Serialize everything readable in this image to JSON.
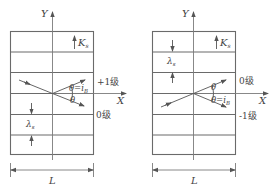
{
  "panels": [
    {
      "id": "left",
      "y_axis_label": "Y",
      "x_axis_label": "X",
      "wave_vector_label": "K",
      "wave_vector_sub": "s",
      "wavelength_label": "λ",
      "wavelength_sub": "s",
      "angle_upper": "θ=i",
      "angle_upper_sub": "B",
      "angle_lower": "θ",
      "order_upper": "+1级",
      "order_lower": "0级",
      "width_label": "L"
    },
    {
      "id": "right",
      "y_axis_label": "Y",
      "x_axis_label": "X",
      "wave_vector_label": "K",
      "wave_vector_sub": "s",
      "wavelength_label": "λ",
      "wavelength_sub": "s",
      "angle_upper": "θ",
      "angle_lower": "θ=i",
      "angle_lower_sub": "B",
      "order_upper": "0级",
      "order_lower": "-1级",
      "width_label": "L"
    }
  ]
}
